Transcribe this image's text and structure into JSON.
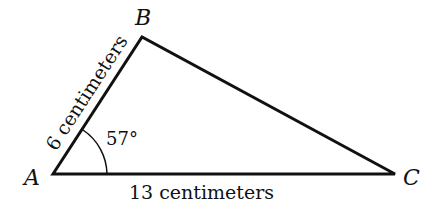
{
  "figure": {
    "vertices": {
      "A": {
        "label": "A"
      },
      "B": {
        "label": "B"
      },
      "C": {
        "label": "C"
      }
    },
    "sides": {
      "AB": {
        "label": "6 centimeters"
      },
      "AC": {
        "label": "13 centimeters"
      }
    },
    "angles": {
      "A": {
        "label": "57°"
      }
    },
    "colors": {
      "stroke": "#111111",
      "background": "#ffffff"
    }
  }
}
